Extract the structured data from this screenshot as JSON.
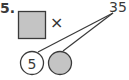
{
  "problem": {
    "number": "5.",
    "operator": "×",
    "product": "35",
    "known_factor": "5",
    "unknown_factor_box": "",
    "unknown_factor_circle": ""
  },
  "colors": {
    "fill_gray": "#c4c4c4",
    "stroke": "#3a3a3a"
  }
}
